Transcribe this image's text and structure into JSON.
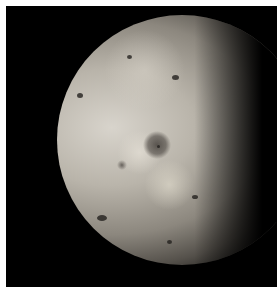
{
  "image": {
    "subject": "moon-gibbous-phase",
    "description": "Grayscale photograph of a mottled planetary moon (Io-like) in gibbous phase on black background with white border",
    "colors": {
      "border": "#ffffff",
      "background": "#000000",
      "surface_light": "#d8d4cc",
      "surface_dark": "#55514b"
    }
  }
}
